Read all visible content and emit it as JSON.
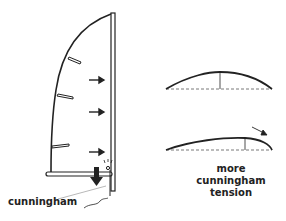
{
  "diagram": {
    "colors": {
      "stroke": "#222222",
      "background": "#ffffff",
      "dashed": "#555555"
    },
    "sail": {
      "arrows": [
        "wind-arrow",
        "wind-arrow",
        "wind-arrow",
        "wind-arrow"
      ],
      "battens": 3
    },
    "labels": {
      "cunningham": "cunningham",
      "tension_caption": [
        "more",
        "cunningham",
        "tension"
      ]
    },
    "foils": [
      {
        "name": "normal-draft-profile",
        "draft_position": "middle"
      },
      {
        "name": "tensioned-draft-profile",
        "draft_position": "forward"
      }
    ]
  }
}
